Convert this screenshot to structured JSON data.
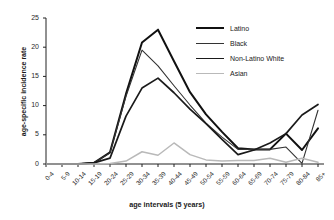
{
  "chart_data": {
    "type": "line",
    "title": "",
    "xlabel": "age intervals (5 years)",
    "ylabel": "age-specific incidence rate",
    "categories": [
      "0-4",
      "5-9",
      "10-14",
      "15-19",
      "20-24",
      "25-29",
      "30-34",
      "35-39",
      "40-44",
      "45-49",
      "50-54",
      "55-59",
      "60-64",
      "65-69",
      "70-74",
      "75-79",
      "80-84",
      "85+"
    ],
    "ylim": [
      0,
      25
    ],
    "yticks": [
      0,
      5,
      10,
      15,
      20,
      25
    ],
    "grid": false,
    "legend_position": "top-right",
    "series": [
      {
        "name": "Latino",
        "color": "#111111",
        "width": 2.0,
        "values": [
          0,
          0,
          0,
          0.2,
          2.0,
          12.0,
          20.8,
          23.0,
          17.6,
          12.3,
          8.5,
          5.5,
          2.7,
          2.5,
          2.5,
          5.2,
          2.4,
          6.1
        ]
      },
      {
        "name": "Black",
        "color": "#333333",
        "width": 1.1,
        "values": [
          0,
          0,
          0,
          0.2,
          1.9,
          11.6,
          19.5,
          16.8,
          13.4,
          10.1,
          7.0,
          4.6,
          2.5,
          2.5,
          2.5,
          2.9,
          0.1,
          9.2
        ]
      },
      {
        "name": "Non-Latino White",
        "color": "#1a1a1a",
        "width": 1.7,
        "values": [
          0,
          0,
          0,
          0.2,
          1.0,
          8.2,
          13.0,
          14.7,
          12.2,
          9.4,
          6.9,
          4.2,
          1.6,
          2.4,
          3.6,
          5.2,
          8.4,
          10.2
        ]
      },
      {
        "name": "Asian",
        "color": "#b9b9b9",
        "width": 1.5,
        "values": [
          0,
          0,
          0,
          0,
          0.1,
          0.5,
          2.1,
          1.5,
          3.6,
          1.6,
          0.7,
          0.5,
          0.6,
          0.6,
          1.0,
          0.3,
          1.0,
          0.3
        ]
      }
    ]
  },
  "axes": {
    "ytick_labels": [
      "0",
      "5",
      "10",
      "15",
      "20",
      "25"
    ]
  }
}
